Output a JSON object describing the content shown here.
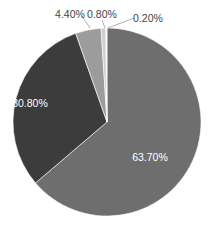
{
  "chart_data": {
    "type": "pie",
    "title": "",
    "start_angle_deg": 0,
    "direction": "clockwise",
    "slices": [
      {
        "label": "63.70%",
        "value": 63.7,
        "color": "#6e6e6e",
        "label_color": "#ffffff"
      },
      {
        "label": "30.80%",
        "value": 30.8,
        "color": "#3c3c3c",
        "label_color": "#ffffff"
      },
      {
        "label": "4.40%",
        "value": 4.4,
        "color": "#9c9c9c",
        "label_color": "#444444"
      },
      {
        "label": "0.80%",
        "value": 0.8,
        "color": "#d0d0d0",
        "label_color": "#444444"
      },
      {
        "label": "0.20%",
        "value": 0.2,
        "color": "#f2f2f2",
        "label_color": "#444444"
      }
    ],
    "legend": "none"
  },
  "layout": {
    "cx": 107,
    "cy": 122,
    "r": 94,
    "labels": [
      {
        "x": 150,
        "y": 161,
        "anchor": "middle",
        "leader": false
      },
      {
        "x": 30,
        "y": 107,
        "anchor": "middle",
        "leader": false
      },
      {
        "x": 70,
        "y": 18,
        "anchor": "middle",
        "leader": [
          82,
          16,
          90,
          28
        ]
      },
      {
        "x": 102,
        "y": 18,
        "anchor": "middle",
        "leader": [
          102,
          20,
          105,
          28
        ]
      },
      {
        "x": 148,
        "y": 22,
        "anchor": "middle",
        "leader": [
          134,
          18,
          108,
          28
        ]
      }
    ]
  }
}
